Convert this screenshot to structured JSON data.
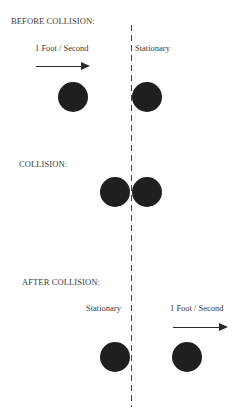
{
  "sections": {
    "before": {
      "title": "BEFORE COLLISION:",
      "moving_label": "1 Foot / Second",
      "stationary_label": "Stationary"
    },
    "collision": {
      "title": "COLLISION:"
    },
    "after": {
      "title": "AFTER COLLISION:",
      "stationary_label": "Stationary",
      "moving_label": "1 Foot / Second"
    }
  },
  "colors": {
    "ball": "#1f1f1f",
    "text": "#3a3a3a",
    "line": "#444444"
  }
}
